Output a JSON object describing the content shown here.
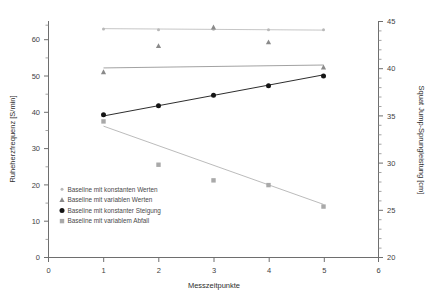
{
  "chart_data": {
    "type": "scatter",
    "title": "",
    "xlabel": "Messzeitpunkte",
    "ylabel": "Ruheherzfrequenz [S/min]",
    "ylabel_right": "Squat Jump-Sprungleistung [cm]",
    "xlim": [
      0,
      6
    ],
    "ylim": [
      0,
      65
    ],
    "ylim_right": [
      20,
      45
    ],
    "grid": false,
    "legend_position": "inside-lower-left",
    "x_ticks": [
      0,
      1,
      2,
      3,
      4,
      5,
      6
    ],
    "x_ticklabels": [
      "0",
      "1",
      "2",
      "3",
      "4",
      "5",
      "6"
    ],
    "y_ticks": [
      0,
      10,
      20,
      30,
      40,
      50,
      60
    ],
    "y_ticklabels": [
      "0",
      "10",
      "20",
      "30",
      "40",
      "50",
      "60"
    ],
    "y_ticks_right": [
      20,
      25,
      30,
      35,
      40,
      45
    ],
    "y_ticklabels_right": [
      "20",
      "25",
      "30",
      "35",
      "40",
      "45"
    ],
    "x": [
      1,
      2,
      3,
      4,
      5
    ],
    "series": [
      {
        "name": "Baseline mit konstanten Werten",
        "marker": "circle-small",
        "color": "#b8b8b8",
        "axis": "left",
        "values": [
          62.8,
          62.6,
          62.7,
          62.6,
          62.6
        ],
        "fit": {
          "y_start": 62.9,
          "y_end": 62.5
        }
      },
      {
        "name": "Baseline mit variablen Werten",
        "marker": "triangle",
        "color": "#8a8a8a",
        "axis": "left",
        "values": [
          51.0,
          58.2,
          63.3,
          59.2,
          52.3
        ],
        "fit": {
          "y_start": 52.1,
          "y_end": 52.9
        }
      },
      {
        "name": "Baseline mit konstanter Steigung",
        "marker": "circle",
        "color": "#151515",
        "axis": "left",
        "values": [
          39.2,
          41.7,
          44.6,
          47.2,
          49.9
        ],
        "fit": {
          "y_start": 38.9,
          "y_end": 50.2
        }
      },
      {
        "name": "Baseline mit variablem Abfall",
        "marker": "square",
        "color": "#a9a9a9",
        "axis": "left",
        "values": [
          37.4,
          25.5,
          21.2,
          19.9,
          14.0
        ],
        "fit": {
          "y_start": 36.1,
          "y_end": 14.6
        }
      }
    ],
    "legend": [
      {
        "label": "Baseline mit konstanten Werten",
        "marker": "circle-small",
        "color": "#b8b8b8"
      },
      {
        "label": "Baseline mit variablen Werten",
        "marker": "triangle",
        "color": "#8a8a8a"
      },
      {
        "label": "Baseline mit konstanter Steigung",
        "marker": "circle",
        "color": "#151515"
      },
      {
        "label": "Baseline mit variablem Abfall",
        "marker": "square",
        "color": "#a9a9a9"
      }
    ]
  }
}
